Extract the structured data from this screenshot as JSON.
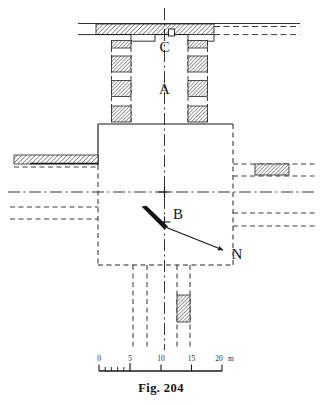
{
  "figure": {
    "caption": "Fig. 204",
    "background_color": "#ffffff",
    "ink_color": "#1a1a1a",
    "hatch_color": "#4a4a4a",
    "type": "archaeological-site-plan"
  },
  "labels": {
    "point_a": "A",
    "point_b": "B",
    "point_c": "C",
    "north": "N"
  },
  "scale_bar": {
    "unit": "m",
    "ticks": [
      "0",
      "5",
      "10",
      "15",
      "20"
    ],
    "unit_label": "m",
    "minor_divisions_first_segment": 5,
    "max_value": 20
  },
  "plan_elements": {
    "top_wall": "hatched-wall-band",
    "top_wall_niche": "central-niche",
    "colonnade_left": "pier-row-left",
    "colonnade_right": "pier-row-right",
    "left_pier_count": 4,
    "right_pier_count": 4,
    "central_court": "main-rectangular-structure",
    "west_wall": "hatched-wall-west",
    "east_wall_block": "hatched-block-east",
    "south_block": "hatched-block-south",
    "axis_vertical": "centerline-north-south",
    "axis_horizontal": "centerline-east-west",
    "north_arrow": "north-arrow-indicator"
  }
}
